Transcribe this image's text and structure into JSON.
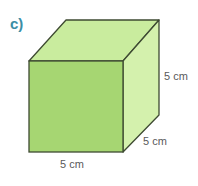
{
  "question_label": "c)",
  "shape": "cube",
  "colors": {
    "front_face": "#a6d672",
    "top_face": "#c9ec9e",
    "side_face": "#d4f1ad",
    "edge": "#3e4a32",
    "label_c": "#3b8ea5",
    "dimension_text": "#5a5a5a"
  },
  "dimensions": {
    "height": "5 cm",
    "depth": "5 cm",
    "width": "5 cm"
  }
}
